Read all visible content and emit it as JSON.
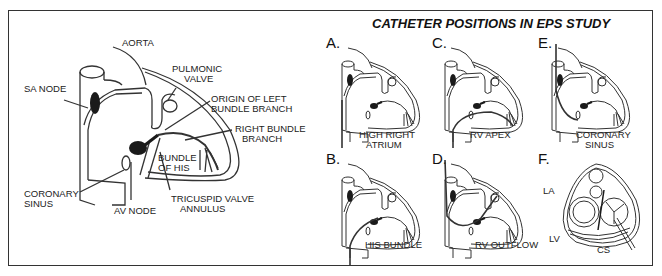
{
  "main_diagram": {
    "labels": {
      "aorta": "AORTA",
      "pulmonic_valve_1": "PULMONIC",
      "pulmonic_valve_2": "VALVE",
      "sa_node": "SA NODE",
      "origin_lbb_1": "ORIGIN OF LEFT",
      "origin_lbb_2": "BUNDLE BRANCH",
      "rbb_1": "RIGHT BUNDLE",
      "rbb_2": "BRANCH",
      "his_1": "BUNDLE",
      "his_2": "OF HIS",
      "coronary_sinus_1": "CORONARY",
      "coronary_sinus_2": "SINUS",
      "av_node": "AV NODE",
      "tricuspid_1": "TRICUSPID VALVE",
      "tricuspid_2": "ANNULUS"
    }
  },
  "catheter_panel": {
    "title": "CATHETER POSITIONS IN EPS STUDY",
    "panels": [
      {
        "letter": "A.",
        "caption_1": "HIGH RIGHT",
        "caption_2": "ATRIUM"
      },
      {
        "letter": "C.",
        "caption_1": "RV APEX",
        "caption_2": ""
      },
      {
        "letter": "E.",
        "caption_1": "CORONARY",
        "caption_2": "SINUS"
      },
      {
        "letter": "B.",
        "caption_1": "HIS BUNDLE",
        "caption_2": ""
      },
      {
        "letter": "D.",
        "caption_1": "RV OUTFLOW",
        "caption_2": ""
      },
      {
        "letter": "F.",
        "caption_1": "",
        "caption_2": ""
      }
    ],
    "f_labels": {
      "la": "LA",
      "lv": "LV",
      "cs": "CS"
    }
  },
  "colors": {
    "line": "#333333",
    "node": "#1a1a1a",
    "frame": "#333333"
  }
}
